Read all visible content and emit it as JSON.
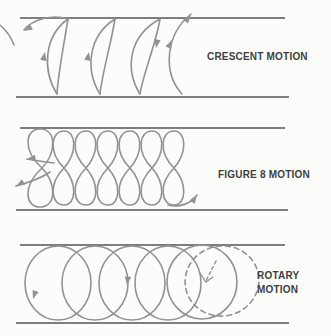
{
  "colors": {
    "line": "#7e7e7e",
    "curve": "#929292",
    "ink": "#3f3f41",
    "background": "#fcfcfa"
  },
  "panels": [
    {
      "id": "crescent",
      "label": "CRESCENT MOTION",
      "pattern": "crescent strokes between two horizontal guide lines",
      "crescent_count": 3,
      "arrow_directions": [
        "down-left",
        "up",
        "up",
        "down",
        "up",
        "up-right"
      ]
    },
    {
      "id": "figure8",
      "label": "FIGURE 8 MOTION",
      "pattern": "overlapping figure-eight loops between two horizontal guide lines",
      "loop_count": 7,
      "arrow_directions": [
        "left",
        "down-left",
        "up-right"
      ]
    },
    {
      "id": "rotary",
      "label_line1": "ROTARY",
      "label_line2": "MOTION",
      "pattern": "overlapping circles between two horizontal guide lines, last circle dashed",
      "solid_circle_count": 5,
      "dashed_circle_count": 1,
      "arrow_directions": [
        "down",
        "down",
        "down-left (dashed)"
      ]
    }
  ]
}
